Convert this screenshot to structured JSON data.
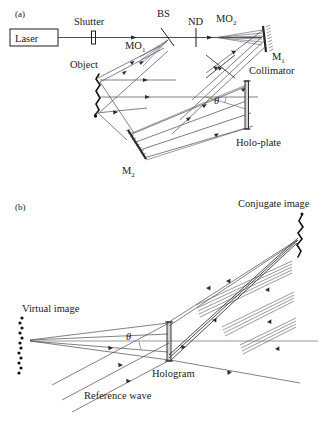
{
  "figure": {
    "background_color": "#ffffff",
    "ink_color": "#1f1f24",
    "ray_color": "#4a4a55",
    "plate_fill_color": "#d6d6da",
    "width": 329,
    "height": 423
  },
  "panels": [
    {
      "tag": "(a)",
      "name": "recording-setup",
      "labels": {
        "laser": "Laser",
        "shutter": "Shutter",
        "beam_splitter": "BS",
        "neutral_density": "ND",
        "microscope_objective_1": "MO",
        "microscope_objective_1_sub": "1",
        "microscope_objective_2": "MO",
        "microscope_objective_2_sub": "2",
        "mirror_1": "M",
        "mirror_1_sub": "1",
        "mirror_2": "M",
        "mirror_2_sub": "2",
        "object": "Object",
        "collimator": "Collimator",
        "holo_plate": "Holo-plate",
        "angle": "θ"
      }
    },
    {
      "tag": "(b)",
      "name": "reconstruction-setup",
      "labels": {
        "conjugate_image": "Conjugate image",
        "virtual_image": "Virtual image",
        "hologram": "Hologram",
        "reference_wave": "Reference wave",
        "angle": "θ"
      }
    }
  ],
  "components": {
    "laser_box": "laser-source-box",
    "shutter": "shutter-element",
    "bs": "beam-splitter-element",
    "nd": "neutral-density-filter",
    "mo1": "microscope-objective-1",
    "mo2": "microscope-objective-2",
    "m1": "mirror-1",
    "m2": "mirror-2",
    "collimator": "collimator-lens",
    "holoplate": "holographic-plate",
    "object": "diffusing-object",
    "hologram": "hologram-plate",
    "virtual_image": "virtual-image-shape",
    "conjugate_image": "conjugate-image-shape"
  }
}
